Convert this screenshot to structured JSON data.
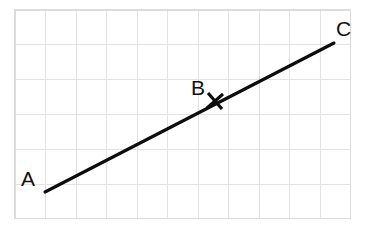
{
  "figure": {
    "width": 368,
    "height": 228,
    "background_color": "#ffffff"
  },
  "grid": {
    "line_color": "#e3e3e5",
    "border_color": "#dcdcdf",
    "left": 15,
    "top": 10,
    "right": 351,
    "bottom": 219,
    "column_spacing": 30.5,
    "row_spacing": 34.8,
    "columns": 11,
    "rows": 6,
    "vertical_lines": [
      15,
      45.5,
      76,
      106.5,
      137,
      167.5,
      198,
      228.5,
      259,
      289.5,
      320,
      350.5
    ],
    "horizontal_lines": [
      10,
      44.8,
      79.6,
      114.4,
      149.2,
      184,
      218.8
    ]
  },
  "segment": {
    "color": "#0d0d0d",
    "stroke_width": 3.1,
    "start": {
      "x": 45,
      "y": 192
    },
    "end": {
      "x": 334,
      "y": 43
    }
  },
  "tick_mark": {
    "name": "cross-tick-at-b",
    "color": "#0d0d0d",
    "stroke_width": 3.1,
    "center": {
      "x": 215,
      "y": 101
    },
    "stroke_1": {
      "x1": 207,
      "y1": 108,
      "x2": 223,
      "y2": 94
    },
    "stroke_2": {
      "x1": 208,
      "y1": 93,
      "x2": 222,
      "y2": 109
    }
  },
  "labels": {
    "a": {
      "text": "A",
      "x": 21,
      "y": 168
    },
    "b": {
      "text": "B",
      "x": 191,
      "y": 77
    },
    "c": {
      "text": "C",
      "x": 336,
      "y": 18
    }
  }
}
